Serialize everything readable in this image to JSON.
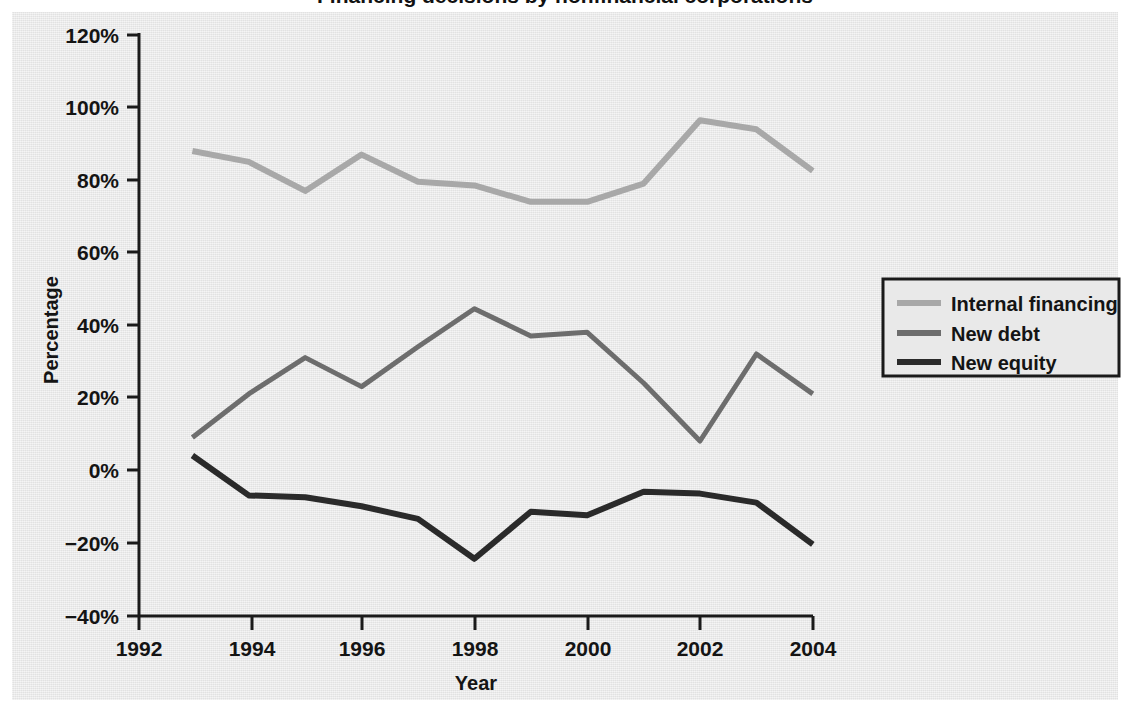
{
  "figure": {
    "title_clipped": "Financing decisions by nonfinancial corporations",
    "background_color": "#e9e9e9",
    "page_color": "#ffffff"
  },
  "axes": {
    "y": {
      "label": "Percentage",
      "ticks": [
        "120%",
        "100%",
        "80%",
        "60%",
        "40%",
        "20%",
        "0%",
        "−20%",
        "−40%"
      ],
      "tick_values": [
        120,
        100,
        80,
        60,
        40,
        20,
        0,
        -20,
        -40
      ],
      "min": -40,
      "max": 120
    },
    "x": {
      "label": "Year",
      "ticks": [
        "1992",
        "1994",
        "1996",
        "1998",
        "2000",
        "2002",
        "2004"
      ],
      "tick_values": [
        1992,
        1994,
        1996,
        1998,
        2000,
        2002,
        2004
      ],
      "min": 1992,
      "max": 2004
    }
  },
  "legend": {
    "position": "right",
    "items": [
      {
        "label": "Internal financing",
        "color": "#a8a8a8"
      },
      {
        "label": "New debt",
        "color": "#6d6d6d"
      },
      {
        "label": "New equity",
        "color": "#2a2a2a"
      }
    ]
  },
  "chart_data": {
    "type": "line",
    "title": "Financing decisions by nonfinancial corporations",
    "xlabel": "Year",
    "ylabel": "Percentage",
    "xlim": [
      1992,
      2004
    ],
    "ylim": [
      -40,
      120
    ],
    "grid": false,
    "legend_position": "right",
    "x": [
      1993,
      1994,
      1995,
      1996,
      1997,
      1998,
      1999,
      2000,
      2001,
      2002,
      2003,
      2004
    ],
    "series": [
      {
        "name": "Internal financing",
        "color": "#a8a8a8",
        "values": [
          88,
          85,
          77,
          87,
          79.5,
          78.5,
          74,
          74,
          79,
          96.5,
          94,
          82.5
        ]
      },
      {
        "name": "New debt",
        "color": "#6d6d6d",
        "values": [
          9,
          21,
          31,
          23,
          34,
          44.5,
          37,
          38,
          24,
          8,
          32,
          21
        ]
      },
      {
        "name": "New equity",
        "color": "#2a2a2a",
        "values": [
          4,
          -7,
          -7.5,
          -10,
          -13.5,
          -24.5,
          -11.5,
          -12.5,
          -6,
          -6.5,
          -9,
          -20.5
        ]
      }
    ]
  },
  "geometry": {
    "x_origin_px": 136,
    "px_per_year": 56.4,
    "y_zero_px": 470,
    "px_per_percent": 3.625,
    "plot_left_px": 139,
    "plot_bottom_px": 616,
    "plot_right_px": 813,
    "plot_top_px": 35,
    "legend_box": {
      "x": 883,
      "y": 279,
      "w": 236,
      "h": 97
    }
  }
}
